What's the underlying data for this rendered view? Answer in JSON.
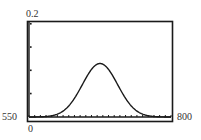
{
  "window": {
    "xmin_label": "550",
    "xmax_label": "800",
    "ymin_label": "0",
    "ymax_label": "0.2"
  },
  "colors": {
    "frame": "#1a1a1a",
    "curve": "#1a1a1a",
    "axis": "#1a1a1a",
    "background": "#ffffff"
  },
  "chart_data": {
    "type": "line",
    "title": "",
    "xlabel": "",
    "ylabel": "",
    "xlim": [
      550,
      800
    ],
    "ylim": [
      0,
      0.2
    ],
    "grid": false,
    "legend": "none",
    "x_tick_spacing": 10,
    "y_tick_spacing": 0.05,
    "series": [
      {
        "name": "normal curve",
        "shape": "normal",
        "mean": 675,
        "peak": 0.115,
        "sigma": 31,
        "x": [
          550,
          575,
          590,
          600,
          610,
          620,
          630,
          640,
          650,
          660,
          670,
          675,
          680,
          690,
          700,
          710,
          720,
          730,
          740,
          750,
          760,
          775,
          800
        ],
        "values": [
          0.0,
          0.0005,
          0.003,
          0.006,
          0.013,
          0.024,
          0.04,
          0.06,
          0.082,
          0.102,
          0.114,
          0.115,
          0.114,
          0.102,
          0.082,
          0.06,
          0.04,
          0.024,
          0.013,
          0.006,
          0.003,
          0.0005,
          0.0
        ]
      }
    ]
  }
}
